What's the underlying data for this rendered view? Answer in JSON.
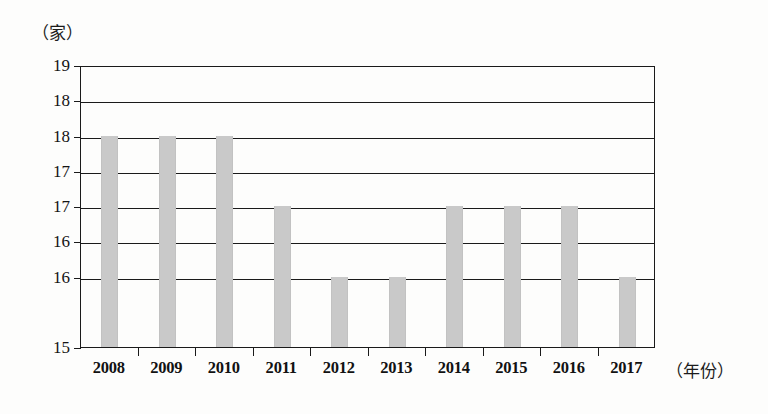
{
  "chart_data": {
    "type": "bar",
    "title": "",
    "subtitle": "",
    "xlabel": "（年份）",
    "ylabel": "（家）",
    "categories": [
      "2008",
      "2009",
      "2010",
      "2011",
      "2012",
      "2013",
      "2014",
      "2015",
      "2016",
      "2017"
    ],
    "values": [
      18,
      18,
      18,
      17,
      16,
      16,
      17,
      17,
      17,
      16
    ],
    "series": [
      {
        "name": "家数",
        "values": [
          18,
          18,
          18,
          17,
          16,
          16,
          17,
          17,
          17,
          16
        ]
      }
    ],
    "ylim": [
      15,
      19
    ],
    "ytick_values": [
      19,
      18.5,
      18,
      17.5,
      17,
      16.5,
      16,
      15.5,
      15
    ],
    "ytick_labels": [
      "19",
      "18",
      "18",
      "17",
      "17",
      "16",
      "16",
      "15"
    ],
    "ytick_positions": [
      19,
      18.5,
      18,
      17.5,
      17,
      16.5,
      16,
      15
    ],
    "grid": "horizontal",
    "legend": "none",
    "bar_color": "#c9c9c9",
    "axis_color": "#1a1a1a",
    "background_color": "#fdfdfc"
  },
  "axes": {
    "y": {
      "unit_label": "（家）",
      "ticks": [
        {
          "label": "19",
          "value": 19
        },
        {
          "label": "18",
          "value": 18.5
        },
        {
          "label": "18",
          "value": 18
        },
        {
          "label": "17",
          "value": 17.5
        },
        {
          "label": "17",
          "value": 17
        },
        {
          "label": "16",
          "value": 16.5
        },
        {
          "label": "16",
          "value": 16
        },
        {
          "label": "15",
          "value": 15
        }
      ]
    },
    "x": {
      "unit_label": "（年份）",
      "ticks": [
        {
          "label": "2008"
        },
        {
          "label": "2009"
        },
        {
          "label": "2010"
        },
        {
          "label": "2011"
        },
        {
          "label": "2012"
        },
        {
          "label": "2013"
        },
        {
          "label": "2014"
        },
        {
          "label": "2015"
        },
        {
          "label": "2016"
        },
        {
          "label": "2017"
        }
      ]
    }
  },
  "bars": [
    {
      "year": "2008",
      "value": 18
    },
    {
      "year": "2009",
      "value": 18
    },
    {
      "year": "2010",
      "value": 18
    },
    {
      "year": "2011",
      "value": 17
    },
    {
      "year": "2012",
      "value": 16
    },
    {
      "year": "2013",
      "value": 16
    },
    {
      "year": "2014",
      "value": 17
    },
    {
      "year": "2015",
      "value": 17
    },
    {
      "year": "2016",
      "value": 17
    },
    {
      "year": "2017",
      "value": 16
    }
  ]
}
